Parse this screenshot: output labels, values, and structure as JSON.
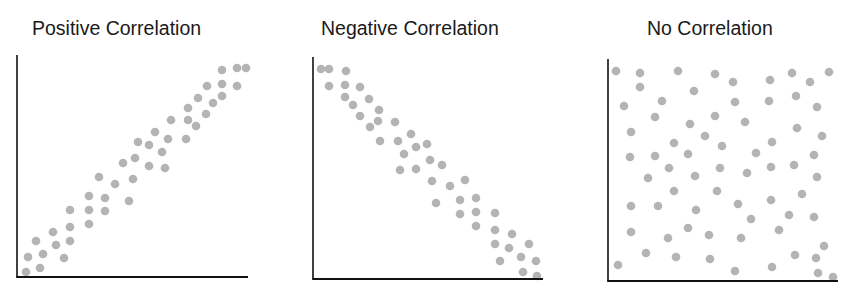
{
  "chart_data": [
    {
      "type": "scatter",
      "title": "Positive Correlation",
      "xlabel": "",
      "ylabel": "",
      "grid": false,
      "axes": {
        "x0": 17,
        "y0": 277,
        "x1": 248,
        "ytop": 55
      },
      "points": [
        [
          222,
          70
        ],
        [
          237,
          68
        ],
        [
          246,
          68
        ],
        [
          207,
          86
        ],
        [
          222,
          84
        ],
        [
          237,
          86
        ],
        [
          198,
          98
        ],
        [
          222,
          96
        ],
        [
          213,
          103
        ],
        [
          188,
          108
        ],
        [
          206,
          114
        ],
        [
          171,
          120
        ],
        [
          188,
          120
        ],
        [
          196,
          126
        ],
        [
          155,
          132
        ],
        [
          186,
          139
        ],
        [
          138,
          142
        ],
        [
          149,
          145
        ],
        [
          168,
          139
        ],
        [
          162,
          152
        ],
        [
          135,
          158
        ],
        [
          123,
          163
        ],
        [
          149,
          166
        ],
        [
          165,
          168
        ],
        [
          99,
          177
        ],
        [
          115,
          184
        ],
        [
          133,
          179
        ],
        [
          89,
          196
        ],
        [
          105,
          198
        ],
        [
          129,
          201
        ],
        [
          70,
          210
        ],
        [
          89,
          210
        ],
        [
          105,
          211
        ],
        [
          70,
          227
        ],
        [
          89,
          224
        ],
        [
          53,
          232
        ],
        [
          70,
          241
        ],
        [
          36,
          241
        ],
        [
          56,
          245
        ],
        [
          28,
          257
        ],
        [
          43,
          254
        ],
        [
          64,
          258
        ],
        [
          26,
          272
        ],
        [
          40,
          268
        ]
      ]
    },
    {
      "type": "scatter",
      "title": "Negative Correlation",
      "xlabel": "",
      "ylabel": "",
      "grid": false,
      "axes": {
        "x0": 313,
        "y0": 279,
        "x1": 543,
        "ytop": 57
      },
      "points": [
        [
          321,
          69
        ],
        [
          329,
          69
        ],
        [
          346,
          71
        ],
        [
          329,
          86
        ],
        [
          345,
          85
        ],
        [
          360,
          87
        ],
        [
          345,
          97
        ],
        [
          369,
          99
        ],
        [
          353,
          105
        ],
        [
          379,
          110
        ],
        [
          360,
          116
        ],
        [
          378,
          121
        ],
        [
          370,
          127
        ],
        [
          395,
          122
        ],
        [
          411,
          134
        ],
        [
          380,
          141
        ],
        [
          398,
          141
        ],
        [
          416,
          147
        ],
        [
          427,
          144
        ],
        [
          404,
          154
        ],
        [
          430,
          160
        ],
        [
          442,
          165
        ],
        [
          400,
          170
        ],
        [
          416,
          169
        ],
        [
          432,
          181
        ],
        [
          450,
          186
        ],
        [
          465,
          180
        ],
        [
          436,
          203
        ],
        [
          460,
          200
        ],
        [
          476,
          198
        ],
        [
          460,
          214
        ],
        [
          476,
          212
        ],
        [
          495,
          213
        ],
        [
          476,
          226
        ],
        [
          495,
          230
        ],
        [
          512,
          234
        ],
        [
          495,
          244
        ],
        [
          509,
          248
        ],
        [
          529,
          244
        ],
        [
          500,
          261
        ],
        [
          521,
          257
        ],
        [
          536,
          261
        ],
        [
          523,
          272
        ],
        [
          537,
          276
        ]
      ]
    },
    {
      "type": "scatter",
      "title": "No Correlation",
      "xlabel": "",
      "ylabel": "",
      "grid": false,
      "axes": {
        "x0": 608,
        "y0": 281,
        "x1": 838,
        "ytop": 59
      },
      "points": [
        [
          616,
          71
        ],
        [
          640,
          73
        ],
        [
          678,
          71
        ],
        [
          715,
          74
        ],
        [
          733,
          82
        ],
        [
          770,
          80
        ],
        [
          792,
          73
        ],
        [
          810,
          82
        ],
        [
          829,
          72
        ],
        [
          640,
          87
        ],
        [
          694,
          91
        ],
        [
          624,
          106
        ],
        [
          662,
          101
        ],
        [
          735,
          102
        ],
        [
          769,
          101
        ],
        [
          796,
          96
        ],
        [
          817,
          107
        ],
        [
          655,
          117
        ],
        [
          715,
          116
        ],
        [
          690,
          124
        ],
        [
          745,
          122
        ],
        [
          631,
          132
        ],
        [
          705,
          136
        ],
        [
          797,
          128
        ],
        [
          822,
          136
        ],
        [
          674,
          143
        ],
        [
          722,
          146
        ],
        [
          772,
          142
        ],
        [
          630,
          157
        ],
        [
          655,
          156
        ],
        [
          688,
          154
        ],
        [
          756,
          153
        ],
        [
          814,
          155
        ],
        [
          669,
          168
        ],
        [
          720,
          168
        ],
        [
          771,
          167
        ],
        [
          794,
          165
        ],
        [
          648,
          178
        ],
        [
          695,
          176
        ],
        [
          747,
          173
        ],
        [
          817,
          177
        ],
        [
          674,
          191
        ],
        [
          717,
          191
        ],
        [
          802,
          194
        ],
        [
          631,
          206
        ],
        [
          658,
          206
        ],
        [
          696,
          210
        ],
        [
          738,
          204
        ],
        [
          771,
          200
        ],
        [
          789,
          215
        ],
        [
          814,
          217
        ],
        [
          751,
          219
        ],
        [
          631,
          232
        ],
        [
          688,
          228
        ],
        [
          668,
          238
        ],
        [
          709,
          235
        ],
        [
          741,
          238
        ],
        [
          779,
          230
        ],
        [
          824,
          246
        ],
        [
          646,
          253
        ],
        [
          676,
          257
        ],
        [
          710,
          259
        ],
        [
          795,
          255
        ],
        [
          816,
          258
        ],
        [
          618,
          265
        ],
        [
          735,
          271
        ],
        [
          772,
          267
        ],
        [
          818,
          273
        ],
        [
          833,
          277
        ]
      ]
    }
  ],
  "style": {
    "dot_color": "#b4b4b4",
    "axis_color": "#111111",
    "dot_radius": 4.3
  },
  "titles": {
    "positive": "Positive Correlation",
    "negative": "Negative Correlation",
    "none": "No Correlation"
  }
}
